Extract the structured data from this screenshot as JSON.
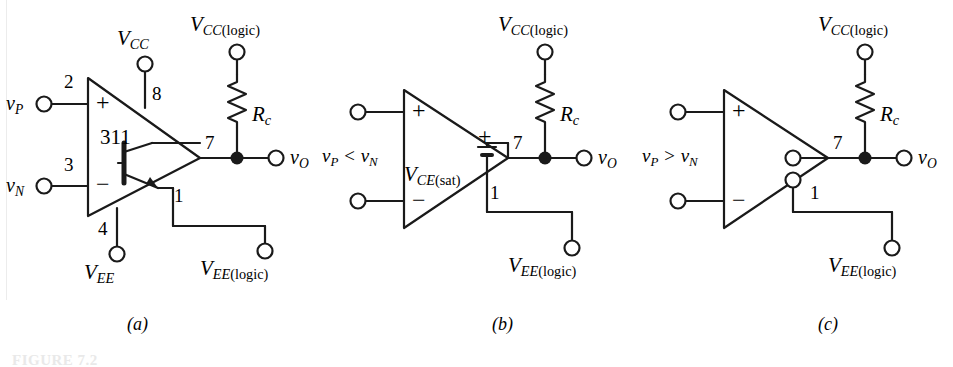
{
  "figure": {
    "background_color": "#ffffff",
    "line_color": "#1a1a1a",
    "bottom_tag": "FIGURE 7.2",
    "panels": [
      {
        "id": "a",
        "caption": "(a)",
        "device_label": "311",
        "inputs": [
          {
            "name": "vP",
            "symbol": "v",
            "sub": "P",
            "pin": "2",
            "polarity": "+"
          },
          {
            "name": "vN",
            "symbol": "v",
            "sub": "N",
            "pin": "3",
            "polarity": "−"
          }
        ],
        "supplies": [
          {
            "name": "VCC",
            "symbol": "V",
            "sub": "CC",
            "suffix": "",
            "pin": "8"
          },
          {
            "name": "VEE",
            "symbol": "V",
            "sub": "EE",
            "suffix": "",
            "pin": "4"
          },
          {
            "name": "VCClogic",
            "symbol": "V",
            "sub": "CC",
            "suffix": "(logic)",
            "pin": ""
          },
          {
            "name": "VEElogic",
            "symbol": "V",
            "sub": "EE",
            "suffix": "(logic)",
            "pin": "1"
          }
        ],
        "resistor": {
          "symbol": "R",
          "sub": "c"
        },
        "output": {
          "symbol": "v",
          "sub": "O",
          "pin": "7"
        },
        "internal_element": "npn-transistor"
      },
      {
        "id": "b",
        "caption": "(b)",
        "condition": "v P  <  v N",
        "condition_parts": {
          "left_sym": "v",
          "left_sub": "P",
          "op": "<",
          "right_sym": "v",
          "right_sub": "N"
        },
        "supplies": [
          {
            "name": "VCClogic",
            "symbol": "V",
            "sub": "CC",
            "suffix": "(logic)",
            "pin": ""
          },
          {
            "name": "VEElogic",
            "symbol": "V",
            "sub": "EE",
            "suffix": "(logic)",
            "pin": "1"
          }
        ],
        "resistor": {
          "symbol": "R",
          "sub": "c"
        },
        "output": {
          "symbol": "v",
          "sub": "O",
          "pin": "7"
        },
        "internal_element": "battery",
        "source": {
          "symbol": "V",
          "sub": "CE",
          "suffix": "(sat)",
          "plus": "+"
        }
      },
      {
        "id": "c",
        "caption": "(c)",
        "condition_parts": {
          "left_sym": "v",
          "left_sub": "P",
          "op": ">",
          "right_sym": "v",
          "right_sub": "N"
        },
        "supplies": [
          {
            "name": "VCClogic",
            "symbol": "V",
            "sub": "CC",
            "suffix": "(logic)",
            "pin": ""
          },
          {
            "name": "VEElogic",
            "symbol": "V",
            "sub": "EE",
            "suffix": "(logic)",
            "pin": "1"
          }
        ],
        "resistor": {
          "symbol": "R",
          "sub": "c"
        },
        "output": {
          "symbol": "v",
          "sub": "O",
          "pin": "7"
        },
        "internal_element": "open-circuit"
      }
    ]
  }
}
